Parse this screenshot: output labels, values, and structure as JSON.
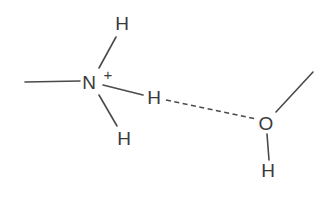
{
  "diagram": {
    "title": "",
    "type": "hydrogen-bond-structure",
    "atoms": {
      "nitrogen": {
        "label": "N",
        "x": 89,
        "y": 89
      },
      "nitrogen_charge": {
        "label": "+",
        "x": 108,
        "y": 79
      },
      "h_top": {
        "label": "H",
        "x": 122,
        "y": 30
      },
      "h_middle": {
        "label": "H",
        "x": 154,
        "y": 104
      },
      "h_bottom": {
        "label": "H",
        "x": 124,
        "y": 145
      },
      "oxygen": {
        "label": "O",
        "x": 266,
        "y": 130
      },
      "h_oxygen": {
        "label": "H",
        "x": 268,
        "y": 177
      }
    },
    "bonds": [
      {
        "name": "methyl-bond",
        "from": "methyl",
        "to": "N",
        "style": "solid"
      },
      {
        "name": "n-h-top-bond",
        "from": "N",
        "to": "H_top",
        "style": "solid"
      },
      {
        "name": "n-h-middle-bond",
        "from": "N",
        "to": "H_middle",
        "style": "solid"
      },
      {
        "name": "n-h-bottom-bond",
        "from": "N",
        "to": "H_bottom",
        "style": "solid"
      },
      {
        "name": "hydrogen-bond",
        "from": "H_middle",
        "to": "O",
        "style": "dashed"
      },
      {
        "name": "o-methyl-bond",
        "from": "O",
        "to": "methyl",
        "style": "solid"
      },
      {
        "name": "o-h-bond",
        "from": "O",
        "to": "H_oxygen",
        "style": "solid"
      }
    ],
    "colors": {
      "line": "#4a4a4a",
      "text": "#3a3a3a",
      "background": "#ffffff"
    }
  }
}
